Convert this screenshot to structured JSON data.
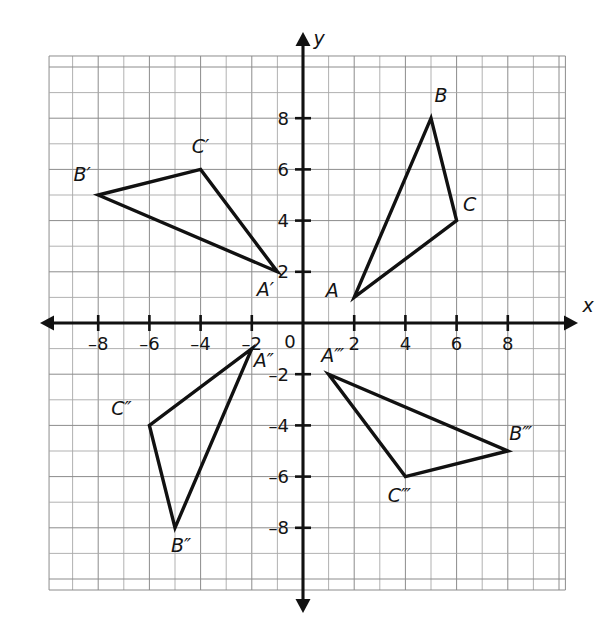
{
  "figure": {
    "type": "coordinate-plane-transformations",
    "background_color": "#ffffff",
    "grid_color": "#8c8c8c",
    "axis_color": "#111111",
    "shape_color": "#111111"
  },
  "axes": {
    "x_axis_label": "x",
    "y_axis_label": "y",
    "origin_label": "0",
    "x_ticks": [
      {
        "value": -8,
        "label": "–8"
      },
      {
        "value": -6,
        "label": "–6"
      },
      {
        "value": -4,
        "label": "–4"
      },
      {
        "value": -2,
        "label": "–2"
      },
      {
        "value": 2,
        "label": "2"
      },
      {
        "value": 4,
        "label": "4"
      },
      {
        "value": 6,
        "label": "6"
      },
      {
        "value": 8,
        "label": "8"
      }
    ],
    "y_ticks": [
      {
        "value": 8,
        "label": "8"
      },
      {
        "value": 6,
        "label": "6"
      },
      {
        "value": 4,
        "label": "4"
      },
      {
        "value": 2,
        "label": "2"
      },
      {
        "value": -2,
        "label": "–2"
      },
      {
        "value": -4,
        "label": "–4"
      },
      {
        "value": -6,
        "label": "–6"
      },
      {
        "value": -8,
        "label": "–8"
      }
    ],
    "x_range": [
      -10,
      10
    ],
    "y_range": [
      -10,
      10
    ],
    "grid": true
  },
  "chart_data": {
    "type": "scatter",
    "title": "",
    "xlabel": "x",
    "ylabel": "y",
    "xlim": [
      -10.2,
      10.4
    ],
    "ylim": [
      -10.7,
      10.6
    ],
    "grid": true,
    "legend": "none",
    "shapes": [
      {
        "name": "triangle-abc",
        "vertices": [
          {
            "label": "A",
            "x": 2,
            "y": 1,
            "label_dx": -22,
            "label_dy": 0
          },
          {
            "label": "B",
            "x": 5,
            "y": 8,
            "label_dx": 10,
            "label_dy": -16
          },
          {
            "label": "C",
            "x": 6,
            "y": 4,
            "label_dx": 13,
            "label_dy": -10
          }
        ]
      },
      {
        "name": "triangle-a-prime-b-prime-c-prime",
        "vertices": [
          {
            "label": "A′",
            "x": -1,
            "y": 2,
            "label_dx": -12,
            "label_dy": 24
          },
          {
            "label": "B′",
            "x": -8,
            "y": 5,
            "label_dx": -16,
            "label_dy": -14
          },
          {
            "label": "C′",
            "x": -4,
            "y": 6,
            "label_dx": 0,
            "label_dy": -16
          }
        ]
      },
      {
        "name": "triangle-a-double-prime-b-double-prime-c-double-prime",
        "vertices": [
          {
            "label": "A″",
            "x": -2,
            "y": -1,
            "label_dx": 12,
            "label_dy": 18
          },
          {
            "label": "B″",
            "x": -5,
            "y": -8,
            "label_dx": 6,
            "label_dy": 24
          },
          {
            "label": "C″",
            "x": -6,
            "y": -4,
            "label_dx": -28,
            "label_dy": -10
          }
        ]
      },
      {
        "name": "triangle-a-triple-prime-b-triple-prime-c-triple-prime",
        "vertices": [
          {
            "label": "A‴",
            "x": 1,
            "y": -2,
            "label_dx": 4,
            "label_dy": -12
          },
          {
            "label": "B‴",
            "x": 8,
            "y": -5,
            "label_dx": 13,
            "label_dy": -11
          },
          {
            "label": "C‴",
            "x": 4,
            "y": -6,
            "label_dx": -6,
            "label_dy": 25
          }
        ]
      }
    ]
  }
}
